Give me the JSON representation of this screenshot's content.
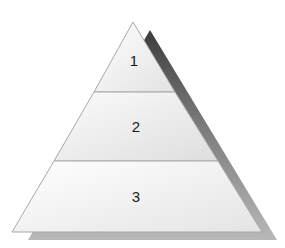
{
  "diagram": {
    "type": "pyramid",
    "levels": [
      {
        "label": "1"
      },
      {
        "label": "2"
      },
      {
        "label": "3"
      }
    ],
    "colors": {
      "fill_top": "#ffffff",
      "fill_bottom": "#dcdcdc",
      "outline": "#a8a8a8",
      "shadow_dark": "#4a4a4a",
      "shadow_light": "#b5b5b5"
    }
  }
}
